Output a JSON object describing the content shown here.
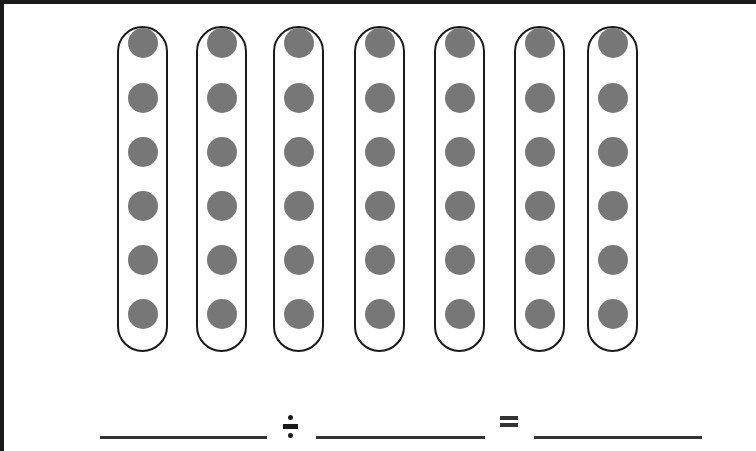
{
  "diagram": {
    "type": "division-array",
    "groups": 7,
    "items_per_group": 6,
    "total_items": 42,
    "colors": {
      "dot": "#777777",
      "outline": "#1a1a1a",
      "blank_line": "#333333"
    },
    "pills": [
      {
        "left": 117,
        "dots": 6
      },
      {
        "left": 196,
        "dots": 6
      },
      {
        "left": 273,
        "dots": 6
      },
      {
        "left": 354,
        "dots": 6
      },
      {
        "left": 434,
        "dots": 6
      },
      {
        "left": 514,
        "dots": 6
      },
      {
        "left": 587,
        "dots": 6
      }
    ],
    "dot_rows_y": [
      35,
      90,
      144,
      198,
      252,
      306
    ]
  },
  "equation": {
    "operator_1": "÷",
    "operator_2": "=",
    "blanks": [
      {
        "left": 100,
        "width": 167,
        "value": ""
      },
      {
        "left": 316,
        "width": 169,
        "value": ""
      },
      {
        "left": 534,
        "width": 168,
        "value": ""
      }
    ]
  }
}
